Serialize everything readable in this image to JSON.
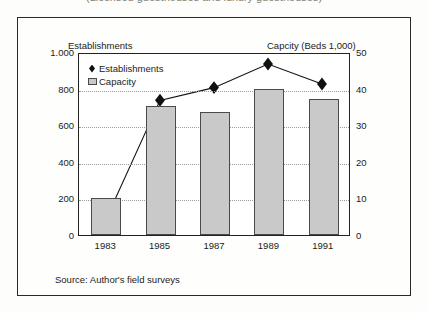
{
  "figure": {
    "title_clipped": "(Licensed guesthouses and luxury guesthouses)",
    "source_note": "Source: Author's field surveys",
    "left_axis_header": "Establishments",
    "right_axis_header": "Capcity (Beds 1,000)"
  },
  "legend": {
    "items": [
      {
        "label": "Establishments",
        "marker": "diamond-marker-icon",
        "color": "#111111"
      },
      {
        "label": "Capacity",
        "marker": "bar-swatch-icon",
        "color": "#c9c9c9"
      }
    ]
  },
  "chart_data": {
    "type": "bar",
    "title": "(Licensed guesthouses and luxury guesthouses)",
    "xlabel": "",
    "ylabel": "Establishments",
    "y2label": "Capcity (Beds 1,000)",
    "categories": [
      "1983",
      "1985",
      "1987",
      "1989",
      "1991"
    ],
    "ylim": [
      0,
      1000
    ],
    "y2lim": [
      0,
      50
    ],
    "yticks": [
      "0",
      "200",
      "400",
      "600",
      "800",
      "1.000"
    ],
    "y2ticks": [
      "0",
      "10",
      "20",
      "30",
      "40",
      "50"
    ],
    "grid": true,
    "legend_position": "top-left-inside",
    "series": [
      {
        "name": "Capacity",
        "kind": "bar",
        "axis": "right",
        "unit": "Beds 1,000",
        "values": [
          10.0,
          35.3,
          33.5,
          40.0,
          37.3
        ],
        "color": "#c9c9c9"
      },
      {
        "name": "Establishments",
        "kind": "line",
        "axis": "left",
        "unit": "count",
        "values": [
          90,
          745,
          815,
          945,
          835
        ],
        "color": "#111111",
        "marker": "diamond"
      }
    ]
  }
}
